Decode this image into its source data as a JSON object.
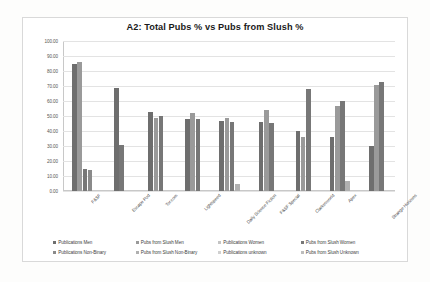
{
  "chart_data": {
    "type": "bar",
    "title": "A2: Total Pubs % vs Pubs from Slush %",
    "xlabel": "",
    "ylabel": "",
    "ylim": [
      0,
      100
    ],
    "ytick_labels": [
      "100.00",
      "90.00",
      "80.00",
      "70.00",
      "60.00",
      "50.00",
      "40.00",
      "30.00",
      "20.00",
      "10.00",
      "0.00"
    ],
    "ytick_values": [
      100,
      90,
      80,
      70,
      60,
      50,
      40,
      30,
      20,
      10,
      0
    ],
    "grid": true,
    "legend_position": "bottom",
    "categories": [
      "F&SF",
      "Escape Pod",
      "Tor.com",
      "Lightspeed",
      "Daily Science Fiction",
      "F&SF Special",
      "Clarkesworld",
      "Apex",
      "Strange Horizons"
    ],
    "series": [
      {
        "name": "Publications Men",
        "color": "#6e6e6e",
        "values": [
          85.0,
          69.0,
          53.0,
          48.0,
          46.5,
          46.0,
          40.0,
          36.0,
          30.0
        ]
      },
      {
        "name": "Pubs from Slush Men",
        "color": "#9a9a9a",
        "values": [
          86.0,
          null,
          49.0,
          52.0,
          49.0,
          54.0,
          36.0,
          57.0,
          71.0
        ]
      },
      {
        "name": "Publications Women",
        "color": "#c4c4c4",
        "values": [
          null,
          null,
          null,
          null,
          null,
          null,
          null,
          null,
          null
        ]
      },
      {
        "name": "Pubs from Slush Women",
        "color": "#777777",
        "values": [
          15.0,
          31.0,
          50.0,
          48.0,
          46.0,
          45.5,
          68.0,
          60.0,
          73.0
        ]
      },
      {
        "name": "Publications Non-Binary",
        "color": "#8a8a8a",
        "values": [
          14.0,
          null,
          null,
          null,
          null,
          null,
          null,
          null,
          null
        ]
      },
      {
        "name": "Pubs from Slush Non-Binary",
        "color": "#b0b0b0",
        "values": [
          null,
          null,
          null,
          null,
          4.5,
          null,
          null,
          7.0,
          null
        ]
      },
      {
        "name": "Publications unknown",
        "color": "#d0d0d0",
        "values": [
          null,
          null,
          null,
          null,
          null,
          null,
          null,
          null,
          null
        ]
      },
      {
        "name": "Pubs from Slush Unknown",
        "color": "#bdbdbd",
        "values": [
          null,
          null,
          null,
          null,
          null,
          null,
          null,
          null,
          null
        ]
      }
    ]
  },
  "legend": {
    "items": [
      {
        "label": "Publications Men",
        "color": "#6e6e6e"
      },
      {
        "label": "Pubs from Slush Men",
        "color": "#9a9a9a"
      },
      {
        "label": "Publications Women",
        "color": "#c4c4c4"
      },
      {
        "label": "Pubs from Slush Women",
        "color": "#777777"
      },
      {
        "label": "Publications Non-Binary",
        "color": "#8a8a8a"
      },
      {
        "label": "Pubs from Slush Non-Binary",
        "color": "#b0b0b0"
      },
      {
        "label": "Publications unknown",
        "color": "#d0d0d0"
      },
      {
        "label": "Pubs from Slush Unknown",
        "color": "#bdbdbd"
      }
    ]
  }
}
